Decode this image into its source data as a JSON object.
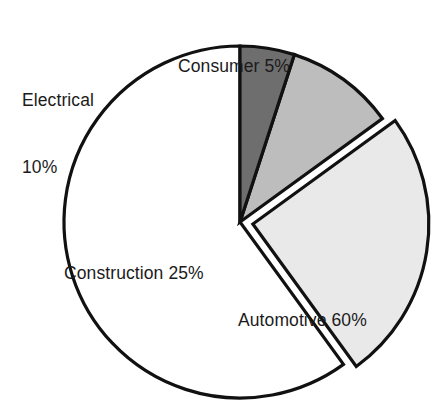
{
  "chart_data": {
    "type": "pie",
    "title": "",
    "subtitle": "",
    "xlabel": "",
    "ylabel": "",
    "grid": false,
    "legend_position": "none",
    "label_format": "{name} {value}%",
    "start_angle_deg": 90,
    "direction": "counterclockwise",
    "categories": [
      "Automotive",
      "Construction",
      "Electrical",
      "Consumer"
    ],
    "values": [
      60,
      25,
      10,
      5
    ],
    "units": "percent",
    "total": 100,
    "slices": [
      {
        "name": "Automotive",
        "value": 60,
        "label": "Automotive 60%",
        "color": "#ffffff",
        "exploded": false,
        "label_placement": "inside"
      },
      {
        "name": "Construction",
        "value": 25,
        "label": "Construction 25%",
        "color": "#e9e9e9",
        "exploded": true,
        "label_placement": "inside"
      },
      {
        "name": "Electrical",
        "value": 10,
        "label": "Electrical 10%",
        "label_line_1": "Electrical",
        "label_line_2": "10%",
        "color": "#bdbdbd",
        "exploded": false,
        "label_placement": "outside"
      },
      {
        "name": "Consumer",
        "value": 5,
        "label": "Consumer 5%",
        "color": "#6e6e6e",
        "exploded": false,
        "label_placement": "outside"
      }
    ],
    "outline_color": "#111111",
    "background_color": "#ffffff"
  },
  "labels": {
    "consumer": "Consumer 5%",
    "electrical_line1": "Electrical",
    "electrical_line2": "10%",
    "construction": "Construction 25%",
    "automotive": "Automotive 60%"
  }
}
